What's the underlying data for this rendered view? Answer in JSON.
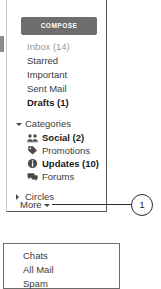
{
  "compose": {
    "label": "COMPOSE",
    "background": "#6e6e6e",
    "text_color": "#ffffff"
  },
  "nav": {
    "items": [
      {
        "label": "Inbox (14)",
        "style": "muted"
      },
      {
        "label": "Starred",
        "style": "normal"
      },
      {
        "label": "Important",
        "style": "normal"
      },
      {
        "label": "Sent Mail",
        "style": "normal"
      },
      {
        "label": "Drafts (1)",
        "style": "bold"
      }
    ]
  },
  "categories_group": {
    "label": "Categories",
    "caret_icon": "triangle-down-icon",
    "expanded": true,
    "items": [
      {
        "label": "Social (2)",
        "icon": "people-icon",
        "style": "bold"
      },
      {
        "label": "Promotions",
        "icon": "tag-icon",
        "style": "normal"
      },
      {
        "label": "Updates (10)",
        "icon": "info-circle-icon",
        "style": "bold"
      },
      {
        "label": "Forums",
        "icon": "speech-bubbles-icon",
        "style": "normal"
      }
    ]
  },
  "circles_group": {
    "label": "Circles",
    "caret_icon": "triangle-right-icon",
    "expanded": false
  },
  "more": {
    "label": "More",
    "caret_icon": "triangle-down-icon"
  },
  "callout": {
    "number": "1",
    "line_color": "#2b2b2b"
  },
  "dropdown": {
    "items": [
      {
        "label": "Chats"
      },
      {
        "label": "All Mail"
      },
      {
        "label": "Spam"
      }
    ]
  }
}
